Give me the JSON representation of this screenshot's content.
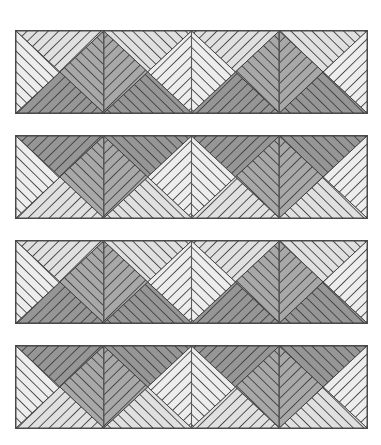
{
  "figure": {
    "canvas": {
      "width": 381,
      "height": 445,
      "background_color": "#ffffff"
    },
    "geometry": {
      "band_left": 15,
      "band_width": 353,
      "band_height": 84,
      "band_tops": [
        30,
        135,
        240,
        345
      ],
      "tiles_per_band": 4,
      "tile_width": 88.25,
      "triangles_per_tile": 4,
      "hatch_angle_degrees": 45,
      "hatch_spacing_px": 7.5
    },
    "colors": {
      "outline": "#4a4a4a",
      "tile_divider": "#5a5a5a",
      "hatch_line": "#3a3a3a",
      "fill_lightest": "#ededed",
      "fill_light": "#e0e0e0",
      "fill_mid": "#c9c9c9",
      "fill_dark": "#a8a8a8",
      "fill_darkest": "#969696",
      "background": "#ffffff"
    },
    "bands": [
      {
        "id": "band-1",
        "label": "Band 1",
        "orientation": "chevron-down",
        "tiles": [
          {
            "label": "Tile 1-1",
            "variant": "A",
            "top_tone": "light",
            "right_tone": "dark",
            "bottom_tone": "darkest",
            "left_tone": "lightest"
          },
          {
            "label": "Tile 1-2",
            "variant": "B",
            "top_tone": "light",
            "right_tone": "lightest",
            "bottom_tone": "darkest",
            "left_tone": "dark"
          },
          {
            "label": "Tile 1-3",
            "variant": "A",
            "top_tone": "light",
            "right_tone": "dark",
            "bottom_tone": "darkest",
            "left_tone": "lightest"
          },
          {
            "label": "Tile 1-4",
            "variant": "B",
            "top_tone": "light",
            "right_tone": "lightest",
            "bottom_tone": "darkest",
            "left_tone": "dark"
          }
        ]
      },
      {
        "id": "band-2",
        "label": "Band 2",
        "orientation": "chevron-up",
        "tiles": [
          {
            "label": "Tile 2-1",
            "variant": "A",
            "top_tone": "darkest",
            "right_tone": "dark",
            "bottom_tone": "light",
            "left_tone": "lightest"
          },
          {
            "label": "Tile 2-2",
            "variant": "B",
            "top_tone": "darkest",
            "right_tone": "lightest",
            "bottom_tone": "light",
            "left_tone": "dark"
          },
          {
            "label": "Tile 2-3",
            "variant": "A",
            "top_tone": "darkest",
            "right_tone": "dark",
            "bottom_tone": "light",
            "left_tone": "lightest"
          },
          {
            "label": "Tile 2-4",
            "variant": "B",
            "top_tone": "darkest",
            "right_tone": "lightest",
            "bottom_tone": "light",
            "left_tone": "dark"
          }
        ]
      },
      {
        "id": "band-3",
        "label": "Band 3",
        "orientation": "chevron-down",
        "tiles": [
          {
            "label": "Tile 3-1",
            "variant": "A",
            "top_tone": "light",
            "right_tone": "dark",
            "bottom_tone": "darkest",
            "left_tone": "lightest"
          },
          {
            "label": "Tile 3-2",
            "variant": "B",
            "top_tone": "light",
            "right_tone": "lightest",
            "bottom_tone": "darkest",
            "left_tone": "dark"
          },
          {
            "label": "Tile 3-3",
            "variant": "A",
            "top_tone": "light",
            "right_tone": "dark",
            "bottom_tone": "darkest",
            "left_tone": "lightest"
          },
          {
            "label": "Tile 3-4",
            "variant": "B",
            "top_tone": "light",
            "right_tone": "lightest",
            "bottom_tone": "darkest",
            "left_tone": "dark"
          }
        ]
      },
      {
        "id": "band-4",
        "label": "Band 4",
        "orientation": "chevron-up",
        "tiles": [
          {
            "label": "Tile 4-1",
            "variant": "A",
            "top_tone": "darkest",
            "right_tone": "dark",
            "bottom_tone": "light",
            "left_tone": "lightest"
          },
          {
            "label": "Tile 4-2",
            "variant": "B",
            "top_tone": "darkest",
            "right_tone": "lightest",
            "bottom_tone": "light",
            "left_tone": "dark"
          },
          {
            "label": "Tile 4-3",
            "variant": "A",
            "top_tone": "darkest",
            "right_tone": "dark",
            "bottom_tone": "light",
            "left_tone": "lightest"
          },
          {
            "label": "Tile 4-4",
            "variant": "B",
            "top_tone": "darkest",
            "right_tone": "lightest",
            "bottom_tone": "light",
            "left_tone": "dark"
          }
        ]
      }
    ]
  }
}
